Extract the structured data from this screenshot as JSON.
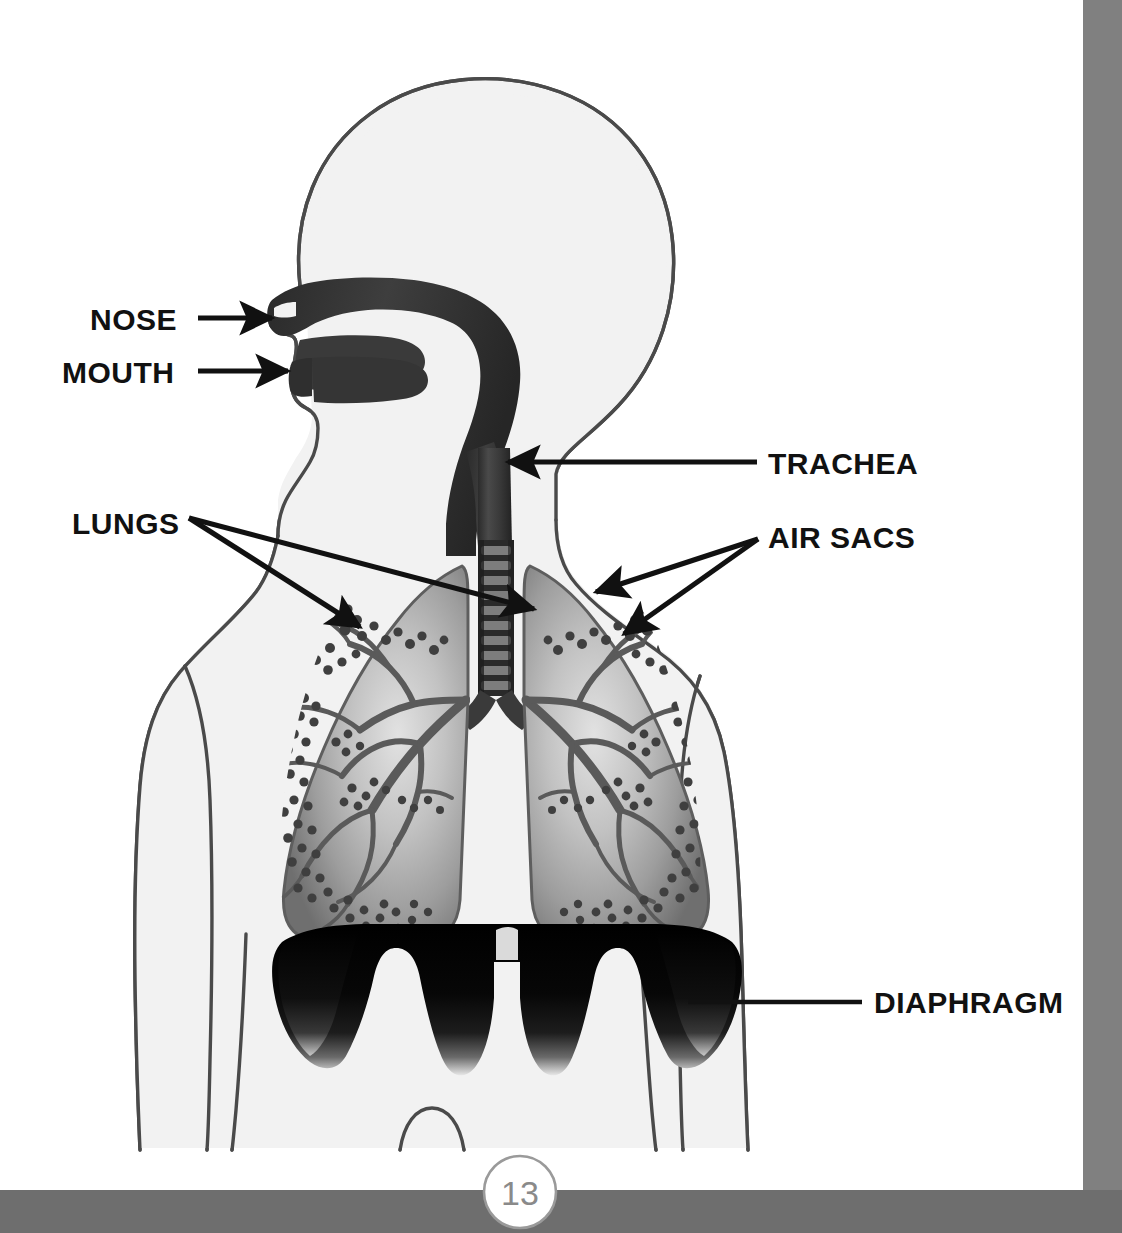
{
  "page": {
    "background_color": "#ffffff",
    "page_number": "13",
    "page_number_circle_border_color": "#9a9a9a",
    "page_number_text_color": "#8a8a8a"
  },
  "margins": {
    "right_bar_color": "#808080",
    "bottom_bar_color": "#6e6e6e",
    "right_bar_x": 1083,
    "bottom_bar_y": 1190
  },
  "colors": {
    "body_fill": "#f2f2f2",
    "body_outline": "#4a4a4a",
    "airway_dark": "#3a3a3a",
    "airway_darker": "#2b2b2b",
    "trachea_ring_light": "#6e6e6e",
    "lung_fill_light": "#d8d8d8",
    "lung_fill_mid": "#9e9e9e",
    "lung_fill_edge": "#6a6a6a",
    "bronchi": "#5a5a5a",
    "alveoli_dots": "#3f3f3f",
    "diaphragm": "#0a0a0a",
    "label_text": "#111111",
    "arrow": "#111111"
  },
  "diagram": {
    "name": "human-respiratory-system",
    "view": "anterior torso with sagittal head",
    "parts": [
      {
        "id": "nose",
        "label": "NOSE"
      },
      {
        "id": "mouth",
        "label": "MOUTH"
      },
      {
        "id": "trachea",
        "label": "TRACHEA"
      },
      {
        "id": "lungs",
        "label": "LUNGS"
      },
      {
        "id": "air-sacs",
        "label": "AIR SACS"
      },
      {
        "id": "diaphragm",
        "label": "DIAPHRAGM"
      }
    ]
  },
  "labels": {
    "nose": {
      "text": "NOSE",
      "x": 90,
      "y": 330,
      "anchor": "start",
      "leader": {
        "type": "arrow",
        "from_x": 198,
        "from_y": 318,
        "to_x": 272,
        "to_y": 318
      }
    },
    "mouth": {
      "text": "MOUTH",
      "x": 62,
      "y": 383,
      "anchor": "start",
      "leader": {
        "type": "arrow",
        "from_x": 198,
        "from_y": 371,
        "to_x": 288,
        "to_y": 371
      }
    },
    "trachea": {
      "text": "TRACHEA",
      "x": 768,
      "y": 474,
      "anchor": "start",
      "leader": {
        "type": "arrow",
        "from_x": 757,
        "from_y": 462,
        "to_x": 508,
        "to_y": 462
      }
    },
    "lungs": {
      "text": "LUNGS",
      "x": 72,
      "y": 534,
      "anchor": "start",
      "leaders": [
        {
          "type": "arrow",
          "from_x": 189,
          "from_y": 518,
          "to_x": 360,
          "to_y": 627
        },
        {
          "type": "arrow",
          "from_x": 189,
          "from_y": 518,
          "to_x": 534,
          "to_y": 609
        }
      ]
    },
    "air_sacs": {
      "text": "AIR SACS",
      "x": 768,
      "y": 548,
      "anchor": "start",
      "leaders": [
        {
          "type": "arrow",
          "from_x": 758,
          "from_y": 539,
          "to_x": 596,
          "to_y": 592
        },
        {
          "type": "arrow",
          "from_x": 758,
          "from_y": 539,
          "to_x": 624,
          "to_y": 634
        }
      ]
    },
    "diaphragm": {
      "text": "DIAPHRAGM",
      "x": 874,
      "y": 1013,
      "anchor": "start",
      "leader": {
        "type": "line",
        "from_x": 862,
        "from_y": 1002,
        "to_x": 688,
        "to_y": 1002
      }
    }
  }
}
